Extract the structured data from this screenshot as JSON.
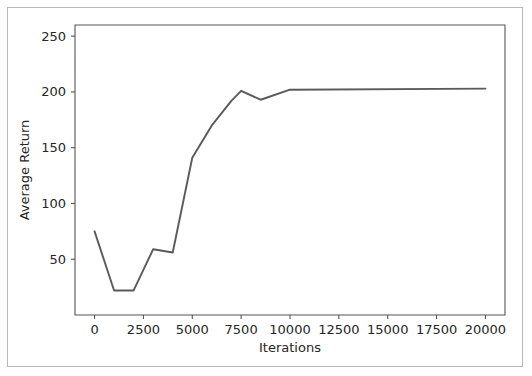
{
  "figure": {
    "background_color": "#ffffff",
    "frame_color": "#b9b9b9",
    "axis_color": "#555555",
    "text_color": "#262626"
  },
  "chart_data": {
    "type": "line",
    "title": "",
    "subtitle": "",
    "xlabel": "Iterations",
    "ylabel": "Average Return",
    "xlim": [
      -1000,
      21000
    ],
    "ylim": [
      0,
      260
    ],
    "grid": false,
    "legend": null,
    "legend_position": "none",
    "line_color": "#5a5a5a",
    "line_width": 1.9,
    "xticks": [
      0,
      2500,
      5000,
      7500,
      10000,
      12500,
      15000,
      17500,
      20000
    ],
    "xtick_labels": [
      "0",
      "2500",
      "5000",
      "7500",
      "10000",
      "12500",
      "15000",
      "17500",
      "20000"
    ],
    "yticks": [
      50,
      100,
      150,
      200,
      250
    ],
    "ytick_labels": [
      "50",
      "100",
      "150",
      "200",
      "250"
    ],
    "series": [
      {
        "name": "Average Return",
        "x": [
          0,
          1000,
          2000,
          3000,
          4000,
          5000,
          6000,
          7000,
          7500,
          8500,
          10000,
          20000
        ],
        "values": [
          75,
          22,
          22,
          59,
          56,
          141,
          170,
          192,
          201,
          193,
          202,
          203
        ]
      }
    ]
  }
}
